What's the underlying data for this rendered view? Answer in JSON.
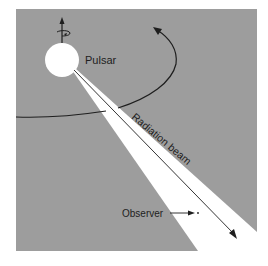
{
  "figure": {
    "labels": {
      "pulsar": "Pulsar",
      "beam": "Radiation beam",
      "observer": "Observer"
    },
    "colors": {
      "background": "#9d9d9d",
      "beam": "#ffffff",
      "pulsar": "#ffffff",
      "lines": "#1e1e1e",
      "page": "#ffffff"
    }
  }
}
